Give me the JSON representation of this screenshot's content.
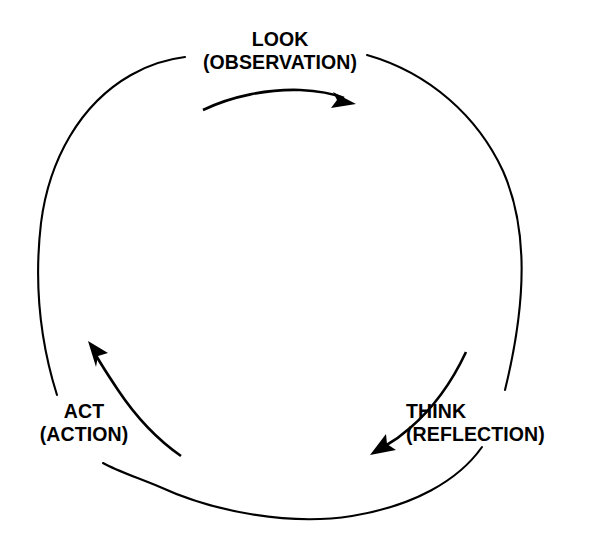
{
  "diagram": {
    "type": "cyclical-process-diagram",
    "shape": "circle",
    "direction": "clockwise",
    "stroke_color": "#000000",
    "background_color": "#ffffff",
    "text_color": "#000000",
    "nodes": [
      {
        "id": "look",
        "title": "LOOK",
        "subtitle": "(OBSERVATION)",
        "position": "top"
      },
      {
        "id": "think",
        "title": "THINK",
        "subtitle": "(REFLECTION)",
        "position": "bottom-right"
      },
      {
        "id": "act",
        "title": "ACT",
        "subtitle": "(ACTION)",
        "position": "bottom-left"
      }
    ],
    "arrows": [
      {
        "id": "look-to-think",
        "from": "look",
        "to": "think",
        "direction": "right"
      },
      {
        "id": "think-to-act",
        "from": "think",
        "to": "act",
        "direction": "down-left"
      },
      {
        "id": "act-to-look",
        "from": "act",
        "to": "look",
        "direction": "up-left"
      }
    ]
  }
}
